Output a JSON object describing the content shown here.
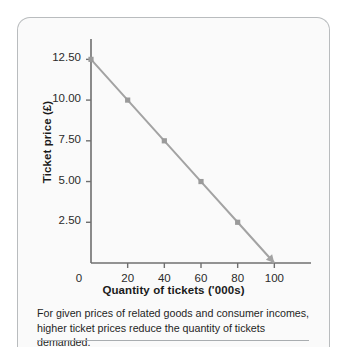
{
  "chart_data": {
    "type": "line",
    "title": "",
    "xlabel": "Quantity of tickets ('000s)",
    "ylabel": "Ticket price (£)",
    "x": [
      0,
      20,
      40,
      60,
      80,
      100
    ],
    "values": [
      12.5,
      10.0,
      7.5,
      5.0,
      2.5,
      0.0
    ],
    "series": [
      {
        "name": "Demand",
        "x": [
          0,
          20,
          40,
          60,
          80,
          100
        ],
        "values": [
          12.5,
          10.0,
          7.5,
          5.0,
          2.5,
          0.0
        ]
      }
    ],
    "xlim": [
      0,
      120
    ],
    "ylim": [
      0,
      13.75
    ],
    "xticks": [
      0,
      20,
      40,
      60,
      80,
      100
    ],
    "yticks": [
      2.5,
      5.0,
      7.5,
      10.0,
      12.5
    ],
    "xtick_labels": [
      "0",
      "20",
      "40",
      "60",
      "80",
      "100"
    ],
    "ytick_labels": [
      "2.50",
      "5.00",
      "7.50",
      "10.00",
      "12.50"
    ],
    "grid": false,
    "legend": false,
    "line_color": "#a3a3a3",
    "marker_color": "#9a9a9a",
    "marker": "square",
    "axis_color": "#6f6f6f",
    "arrow_at_end": true
  },
  "caption": {
    "line1": "For given prices of related goods and consumer incomes,",
    "line2": "higher ticket prices reduce the quantity of tickets demanded."
  },
  "colors": {
    "card_background": "#fafafa",
    "card_border": "#b9bcbe",
    "rule": "#a9adb0",
    "text": "#1b1b1b"
  }
}
